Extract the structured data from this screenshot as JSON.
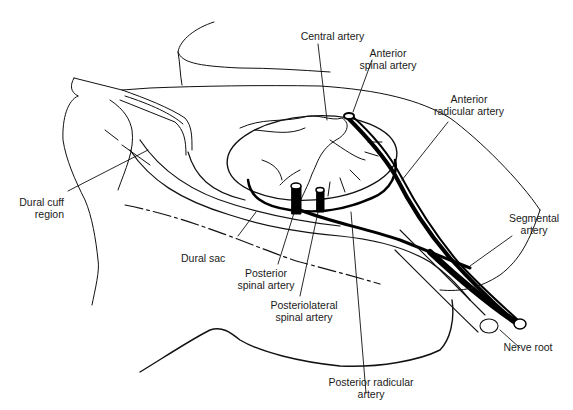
{
  "figure": {
    "colors": {
      "line": "#111111",
      "background": "#ffffff",
      "text": "#1a1a1a"
    }
  },
  "labels": {
    "central_artery": {
      "lines": [
        "Central artery"
      ]
    },
    "anterior_spinal_artery": {
      "lines": [
        "Anterior",
        "spinal artery"
      ]
    },
    "anterior_radicular_artery": {
      "lines": [
        "Anterior",
        "radicular artery"
      ]
    },
    "dural_cuff_region": {
      "lines": [
        "Dural cuff",
        "region"
      ]
    },
    "dural_sac": {
      "lines": [
        "Dural sac"
      ]
    },
    "posterior_spinal_artery": {
      "lines": [
        "Posterior",
        "spinal artery"
      ]
    },
    "posteriolateral_spinal_artery": {
      "lines": [
        "Posteriolateral",
        "spinal artery"
      ]
    },
    "segmental_artery": {
      "lines": [
        "Segmental",
        "artery"
      ]
    },
    "nerve_root": {
      "lines": [
        "Nerve root"
      ]
    },
    "posterior_radicular_artery": {
      "lines": [
        "Posterior radicular",
        "artery"
      ]
    }
  }
}
